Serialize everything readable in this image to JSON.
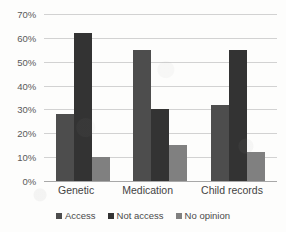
{
  "chart_data": {
    "type": "bar",
    "title": "",
    "xlabel": "",
    "ylabel": "",
    "categories": [
      "Genetic",
      "Medication",
      "Child records"
    ],
    "series": [
      {
        "name": "Access",
        "values": [
          28,
          55,
          32
        ],
        "color": "#4d4d4d"
      },
      {
        "name": "Not access",
        "values": [
          62,
          30,
          55
        ],
        "color": "#333333"
      },
      {
        "name": "No opinion",
        "values": [
          10,
          15,
          12
        ],
        "color": "#808080"
      }
    ],
    "ylim": [
      0,
      70
    ],
    "ytick_step": 10,
    "ytick_labels": [
      "0%",
      "10%",
      "20%",
      "30%",
      "40%",
      "50%",
      "60%",
      "70%"
    ],
    "grid": true,
    "legend_position": "bottom",
    "value_suffix": "%"
  },
  "colors": {
    "background": "#fdfdfc",
    "gridline": "#d2d2d2",
    "axis": "#a8a8a8",
    "tick_text": "#595959",
    "category_text": "#434343",
    "legend_text": "#4a4a4a"
  }
}
